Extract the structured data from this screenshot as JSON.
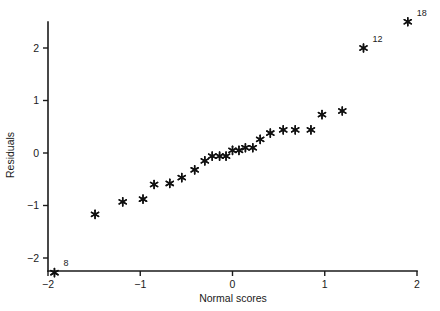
{
  "chart_data": {
    "type": "scatter",
    "title": "",
    "subtitle": "",
    "xlabel": "Normal scores",
    "ylabel": "Residuals",
    "xlim": [
      -2.05,
      2.05
    ],
    "ylim": [
      -2.45,
      2.65
    ],
    "xticks": [
      -2,
      -1,
      0,
      1,
      2
    ],
    "xticklabels": [
      "−2",
      "−1",
      "0",
      "1",
      "2"
    ],
    "yticks": [
      -2,
      -1,
      0,
      1,
      2
    ],
    "yticklabels": [
      "−2",
      "−1",
      "0",
      "1",
      "2"
    ],
    "grid": false,
    "legend": null,
    "marker": "asterisk",
    "marker_color": "#111111",
    "series": [
      {
        "name": "residuals",
        "x": [
          -1.93,
          -1.49,
          -1.19,
          -0.97,
          -0.85,
          -0.68,
          -0.55,
          -0.41,
          -0.3,
          -0.22,
          -0.14,
          -0.07,
          0.0,
          0.07,
          0.14,
          0.22,
          0.3,
          0.41,
          0.55,
          0.68,
          0.85,
          0.97,
          1.19,
          1.42,
          1.9
        ],
        "y": [
          -2.28,
          -1.17,
          -0.93,
          -0.88,
          -0.6,
          -0.58,
          -0.47,
          -0.32,
          -0.15,
          -0.06,
          -0.06,
          -0.06,
          0.05,
          0.05,
          0.1,
          0.1,
          0.26,
          0.38,
          0.44,
          0.44,
          0.44,
          0.73,
          0.8,
          2.0,
          2.5
        ]
      }
    ],
    "annotations": [
      {
        "label": "8",
        "x": -1.93,
        "y": -2.28,
        "dx": 9,
        "dy": -7
      },
      {
        "label": "12",
        "x": 1.42,
        "y": 2.0,
        "dx": 9,
        "dy": -6
      },
      {
        "label": "18",
        "x": 1.9,
        "y": 2.5,
        "dx": 9,
        "dy": -6
      }
    ]
  },
  "axes": {
    "x_axis_name": "normal-scores-axis",
    "y_axis_name": "residuals-axis"
  }
}
